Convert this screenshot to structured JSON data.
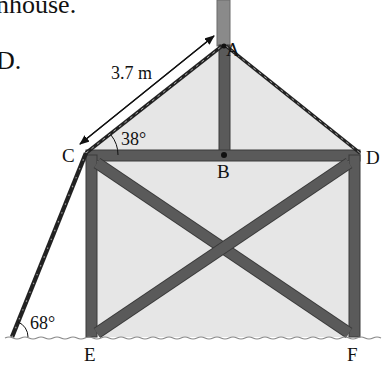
{
  "question_fragment": {
    "line1": "nhouse.",
    "line2": "D."
  },
  "diagram": {
    "points": {
      "A": "A",
      "B": "B",
      "C": "C",
      "D": "D",
      "E": "E",
      "F": "F"
    },
    "measurements": {
      "ladder_length": "3.7 m",
      "roof_angle": "38°",
      "ladder_ground_angle": "68°"
    },
    "colors": {
      "beam": "#5a5a5a",
      "beam_edge": "#3a3a3a",
      "wall_fill": "#e6e6e6",
      "pole": "#8a8a8a",
      "ground": "#888888"
    }
  }
}
